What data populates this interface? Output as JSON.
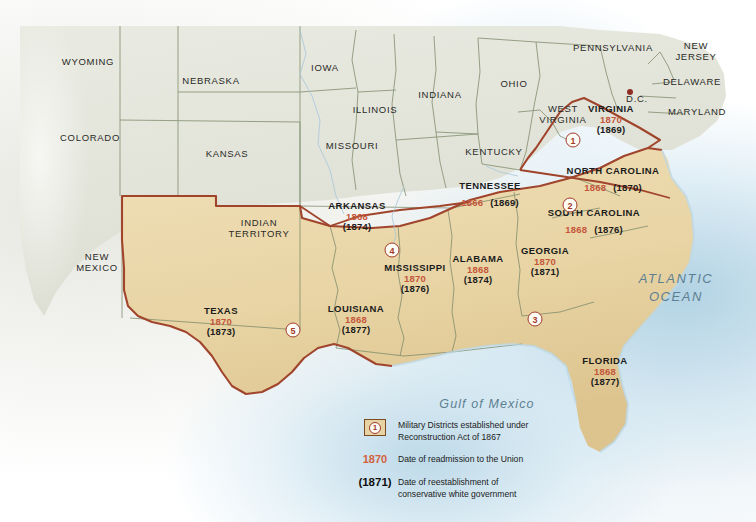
{
  "map": {
    "title": "Reconstruction of the South",
    "colors": {
      "confederate_fill": "#e8d5a8",
      "union_fill": "#e3e4da",
      "confederate_border": "#a0442c",
      "state_border": "#7d8a6a",
      "admission_year": "#c4563a",
      "restoration_year": "#1b1b1b",
      "ocean_label": "#5d7f92",
      "ocean_water": "#b8d8e8"
    },
    "confederate_states": [
      {
        "name": "VIRGINIA",
        "admission": "1870",
        "restoration": "(1869)",
        "layout": "stacked",
        "x": 611,
        "y": 120
      },
      {
        "name": "NORTH CAROLINA",
        "admission": "1868",
        "restoration": "(1870)",
        "layout": "inline",
        "x": 613,
        "y": 180
      },
      {
        "name": "SOUTH CAROLINA",
        "admission": "1868",
        "restoration": "(1876)",
        "layout": "inline",
        "x": 594,
        "y": 222
      },
      {
        "name": "TENNESSEE",
        "admission": "1866",
        "restoration": "(1869)",
        "layout": "inline",
        "x": 490,
        "y": 195
      },
      {
        "name": "ARKANSAS",
        "admission": "1868",
        "restoration": "(1874)",
        "layout": "stacked",
        "x": 357,
        "y": 217
      },
      {
        "name": "MISSISSIPPI",
        "admission": "1870",
        "restoration": "(1876)",
        "layout": "stacked",
        "x": 415,
        "y": 279
      },
      {
        "name": "ALABAMA",
        "admission": "1868",
        "restoration": "(1874)",
        "layout": "stacked",
        "x": 478,
        "y": 270
      },
      {
        "name": "GEORGIA",
        "admission": "1870",
        "restoration": "(1871)",
        "layout": "stacked",
        "x": 545,
        "y": 262
      },
      {
        "name": "LOUISIANA",
        "admission": "1868",
        "restoration": "(1877)",
        "layout": "stacked",
        "x": 356,
        "y": 320
      },
      {
        "name": "TEXAS",
        "admission": "1870",
        "restoration": "(1873)",
        "layout": "stacked",
        "x": 221,
        "y": 322
      },
      {
        "name": "FLORIDA",
        "admission": "1868",
        "restoration": "(1877)",
        "layout": "stacked",
        "x": 605,
        "y": 372
      }
    ],
    "other_regions": [
      {
        "name": "WYOMING",
        "x": 88,
        "y": 62,
        "lines": [
          "WYOMING"
        ]
      },
      {
        "name": "NEBRASKA",
        "x": 211,
        "y": 81,
        "lines": [
          "NEBRASKA"
        ]
      },
      {
        "name": "IOWA",
        "x": 325,
        "y": 68,
        "lines": [
          "IOWA"
        ]
      },
      {
        "name": "ILLINOIS",
        "x": 375,
        "y": 110,
        "lines": [
          "ILLINOIS"
        ]
      },
      {
        "name": "INDIANA",
        "x": 440,
        "y": 95,
        "lines": [
          "INDIANA"
        ]
      },
      {
        "name": "OHIO",
        "x": 514,
        "y": 84,
        "lines": [
          "OHIO"
        ]
      },
      {
        "name": "PENNSYLVANIA",
        "x": 613,
        "y": 48,
        "lines": [
          "PENNSYLVANIA"
        ]
      },
      {
        "name": "NEW JERSEY",
        "x": 696,
        "y": 52,
        "lines": [
          "NEW",
          "JERSEY"
        ]
      },
      {
        "name": "DELAWARE",
        "x": 692,
        "y": 82,
        "lines": [
          "DELAWARE"
        ]
      },
      {
        "name": "MARYLAND",
        "x": 697,
        "y": 112,
        "lines": [
          "MARYLAND"
        ]
      },
      {
        "name": "D.C.",
        "x": 637,
        "y": 99,
        "lines": [
          "D.C."
        ]
      },
      {
        "name": "WEST VIRGINIA",
        "x": 563,
        "y": 115,
        "lines": [
          "WEST",
          "VIRGINIA"
        ]
      },
      {
        "name": "KENTUCKY",
        "x": 494,
        "y": 152,
        "lines": [
          "KENTUCKY"
        ]
      },
      {
        "name": "MISSOURI",
        "x": 352,
        "y": 146,
        "lines": [
          "MISSOURI"
        ]
      },
      {
        "name": "KANSAS",
        "x": 227,
        "y": 154,
        "lines": [
          "KANSAS"
        ]
      },
      {
        "name": "COLORADO",
        "x": 90,
        "y": 138,
        "lines": [
          "COLORADO"
        ]
      },
      {
        "name": "NEW MEXICO",
        "x": 97,
        "y": 263,
        "lines": [
          "NEW",
          "MEXICO"
        ]
      },
      {
        "name": "INDIAN TERRITORY",
        "x": 259,
        "y": 229,
        "lines": [
          "INDIAN",
          "TERRITORY"
        ]
      }
    ],
    "water_labels": [
      {
        "name": "ATLANTIC OCEAN",
        "x": 676,
        "y": 288,
        "lines": [
          "ATLANTIC",
          "OCEAN"
        ]
      },
      {
        "name": "Gulf of Mexico",
        "x": 487,
        "y": 404,
        "lines": [
          "Gulf of Mexico"
        ]
      }
    ],
    "districts": [
      {
        "number": "1",
        "x": 573,
        "y": 140
      },
      {
        "number": "2",
        "x": 570,
        "y": 205
      },
      {
        "number": "3",
        "x": 535,
        "y": 319
      },
      {
        "number": "4",
        "x": 392,
        "y": 250
      },
      {
        "number": "5",
        "x": 293,
        "y": 330
      }
    ],
    "legend": [
      {
        "key_type": "swatch",
        "key_value": "1",
        "lines": [
          "Military Districts established under",
          "Reconstruction Act of 1867"
        ]
      },
      {
        "key_type": "year",
        "key_value": "1870",
        "lines": [
          "Date of readmission to the Union"
        ]
      },
      {
        "key_type": "year-paren",
        "key_value": "(1871)",
        "lines": [
          "Date of reestablishment of",
          "conservative white government"
        ]
      }
    ]
  }
}
